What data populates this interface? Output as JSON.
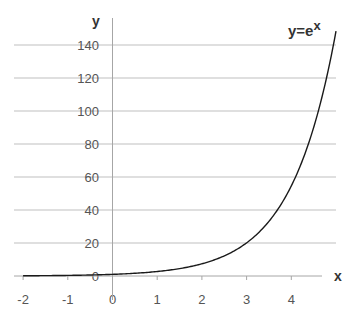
{
  "chart_data": {
    "type": "line",
    "title_base": "y=e",
    "title_superscript": "x",
    "xlabel": "x",
    "ylabel": "y",
    "xlim": [
      -2,
      5
    ],
    "ylim": [
      0,
      150
    ],
    "x_ticks": [
      -2,
      -1,
      0,
      1,
      2,
      3,
      4
    ],
    "x_tick_labels": [
      "-2",
      "-1",
      "0",
      "1",
      "2",
      "3",
      "4"
    ],
    "y_ticks": [
      0,
      20,
      40,
      60,
      80,
      100,
      120,
      140
    ],
    "y_tick_labels": [
      "0",
      "20",
      "40",
      "60",
      "80",
      "100",
      "120",
      "140"
    ],
    "grid": {
      "horizontal": true,
      "vertical": false
    },
    "legend": "none",
    "series": [
      {
        "name": "y=e^x",
        "x": [
          -2,
          -1.5,
          -1,
          -0.5,
          0,
          0.5,
          1,
          1.5,
          2,
          2.5,
          3,
          3.25,
          3.5,
          3.75,
          4,
          4.25,
          4.5,
          4.75,
          5
        ],
        "values": [
          0.14,
          0.22,
          0.37,
          0.61,
          1,
          1.65,
          2.72,
          4.48,
          7.39,
          12.18,
          20.09,
          25.79,
          33.12,
          42.52,
          54.6,
          70.11,
          90.02,
          115.58,
          148.41
        ]
      }
    ]
  },
  "colors": {
    "background": "#ffffff",
    "gridline": "#bfbfbf",
    "axis": "#a6a6a6",
    "curve": "#1a1a1a",
    "text": "#555555"
  }
}
